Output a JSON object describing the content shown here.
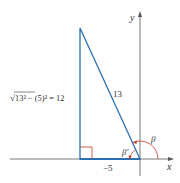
{
  "diagram": {
    "axes": {
      "x_label": "x",
      "y_label": "y"
    },
    "triangle": {
      "hypotenuse_label": "13",
      "base_label": "−5",
      "height_label_parts": {
        "radical": "√",
        "expr": "13² − (5)² = 12"
      }
    },
    "angles": {
      "reference_angle_label": "β′",
      "standard_angle_label": "β"
    },
    "colors": {
      "triangle": "#2a6fb0",
      "triangle_fill": "#e9f1f9",
      "axis": "#555555",
      "right_angle": "#c0392b",
      "arc": "#c0392b",
      "label": "#333333"
    }
  }
}
